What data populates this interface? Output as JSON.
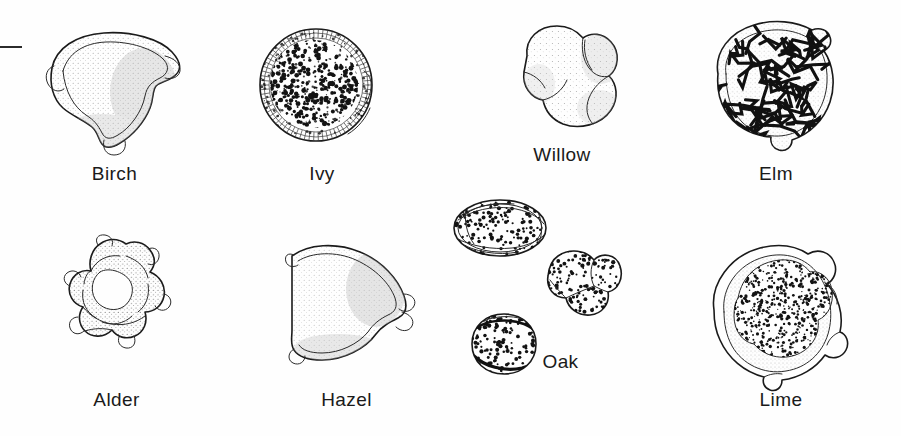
{
  "figure": {
    "type": "botanical-plate",
    "background_color": "#fefefe",
    "ink_color": "#1a1a1a",
    "label_color": "#1a1a1a",
    "rows": 2,
    "columns": 4
  },
  "scale_mark": {
    "name": "scale-bar-fragment",
    "x": 0,
    "y": 46,
    "width": 22,
    "height": 2
  },
  "specimens": [
    {
      "id": "birch",
      "label": "Birch",
      "row": 1,
      "column": 1,
      "shape": "rounded triangular, three protruding pores",
      "texture": "fine stipple shading",
      "art": {
        "x": 32,
        "y": 22,
        "width": 165,
        "height": 140
      },
      "label_pos": {
        "x": 32,
        "y": 163,
        "width": 165
      }
    },
    {
      "id": "ivy",
      "label": "Ivy",
      "row": 1,
      "column": 2,
      "shape": "circular with bumpy granular rim",
      "texture": "dense dark spinules over whole surface",
      "art": {
        "x": 252,
        "y": 22,
        "width": 140,
        "height": 132
      },
      "label_pos": {
        "x": 252,
        "y": 163,
        "width": 140
      }
    },
    {
      "id": "willow",
      "label": "Willow",
      "row": 1,
      "column": 3,
      "shape": "trilobed, three rounded lobes with furrows",
      "texture": "light even stipple",
      "art": {
        "x": 503,
        "y": 18,
        "width": 128,
        "height": 122
      },
      "label_pos": {
        "x": 498,
        "y": 144,
        "width": 128
      }
    },
    {
      "id": "elm",
      "label": "Elm",
      "row": 1,
      "column": 4,
      "shape": "circular with scalloped wavy outline",
      "texture": "rugulate, irregular dark ridges",
      "art": {
        "x": 700,
        "y": 14,
        "width": 152,
        "height": 148
      },
      "label_pos": {
        "x": 700,
        "y": 163,
        "width": 152
      }
    },
    {
      "id": "alder",
      "label": "Alder",
      "row": 2,
      "column": 1,
      "shape": "pentagonal with five protruding pores and connecting arci",
      "texture": "heavy stipple along bands, pale centre",
      "art": {
        "x": 38,
        "y": 232,
        "width": 158,
        "height": 155
      },
      "label_pos": {
        "x": 34,
        "y": 389,
        "width": 165
      }
    },
    {
      "id": "hazel",
      "label": "Hazel",
      "row": 2,
      "column": 2,
      "shape": "rounded triangular with flattened side, pores at corners",
      "texture": "soft graded stipple",
      "art": {
        "x": 278,
        "y": 234,
        "width": 148,
        "height": 150
      },
      "label_pos": {
        "x": 264,
        "y": 389,
        "width": 165
      }
    },
    {
      "id": "oak",
      "label": "Oak",
      "row": 2,
      "column": 3,
      "shape": "three grains: equatorial oval, trilobed polar, oblique pair",
      "texture": "coarse dark dots",
      "art": {
        "x": 452,
        "y": 194,
        "width": 170,
        "height": 192
      },
      "label_pos": {
        "x": 478,
        "y": 389,
        "width": 165
      }
    },
    {
      "id": "lime",
      "label": "Lime",
      "row": 2,
      "column": 4,
      "shape": "large circular, double-walled with inner dotted body",
      "texture": "dense fine dots inside, stippled outer ring",
      "art": {
        "x": 698,
        "y": 238,
        "width": 162,
        "height": 158
      },
      "label_pos": {
        "x": 700,
        "y": 389,
        "width": 165
      }
    }
  ]
}
